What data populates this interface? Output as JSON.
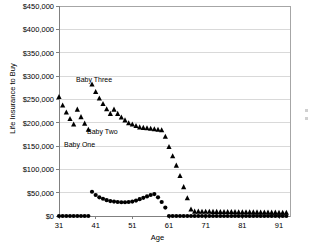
{
  "chart_data": {
    "type": "scatter",
    "title": "",
    "xlabel": "Age",
    "ylabel": "Life Insurance to Buy",
    "xlim": [
      31,
      94
    ],
    "ylim": [
      0,
      450000
    ],
    "xticks": [
      31,
      41,
      51,
      61,
      71,
      81,
      91
    ],
    "yticks": [
      0,
      50000,
      100000,
      150000,
      200000,
      250000,
      300000,
      350000,
      400000,
      450000
    ],
    "ytick_labels": [
      "$0",
      "$50,000",
      "$100,000",
      "$150,000",
      "$200,000",
      "$250,000",
      "$300,000",
      "$350,000",
      "$400,000",
      "$450,000"
    ],
    "xtick_labels": [
      "31",
      "41",
      "51",
      "61",
      "71",
      "81",
      "91"
    ],
    "grid": true,
    "legend_position": "right-cropped",
    "marker_color": "#000000",
    "gridline_color": "#d9d9d9",
    "border_color": "#a6a6a6",
    "series": [
      {
        "name": "insurance-need-triangles",
        "marker": "triangle",
        "x": [
          31,
          32,
          33,
          34,
          35,
          36,
          37,
          38,
          39,
          40,
          41,
          42,
          43,
          44,
          45,
          46,
          47,
          48,
          49,
          50,
          51,
          52,
          53,
          54,
          55,
          56,
          57,
          58,
          59,
          60,
          61,
          62,
          63,
          64,
          65,
          66,
          67,
          68,
          69,
          70,
          71,
          72,
          73,
          74,
          75,
          76,
          77,
          78,
          79,
          80,
          81,
          82,
          83,
          84,
          85,
          86,
          87,
          88,
          89,
          90,
          91,
          92,
          93
        ],
        "y": [
          255000,
          237000,
          222000,
          208000,
          196000,
          228000,
          212000,
          198000,
          185000,
          282000,
          266000,
          252000,
          240000,
          229000,
          219000,
          228000,
          219000,
          211000,
          205000,
          199000,
          196000,
          193000,
          190000,
          189000,
          188000,
          187000,
          186000,
          185000,
          184000,
          170000,
          148000,
          128000,
          108000,
          86000,
          62000,
          38000,
          14000,
          9500,
          9400,
          9300,
          9200,
          9100,
          9000,
          8900,
          8800,
          8700,
          8600,
          8500,
          8400,
          8300,
          8200,
          8100,
          8000,
          7900,
          7800,
          7700,
          7600,
          7500,
          7400,
          7300,
          7200,
          7100,
          7000
        ]
      },
      {
        "name": "available-assets-circles",
        "marker": "circle",
        "x": [
          31,
          32,
          33,
          34,
          35,
          36,
          37,
          38,
          39,
          40,
          41,
          42,
          43,
          44,
          45,
          46,
          47,
          48,
          49,
          50,
          51,
          52,
          53,
          54,
          55,
          56,
          57,
          58,
          59,
          60,
          61,
          62,
          63,
          64,
          65,
          66,
          67,
          68,
          69,
          70,
          71,
          72,
          73,
          74,
          75,
          76,
          77,
          78,
          79,
          80,
          81,
          82,
          83,
          84,
          85,
          86,
          87,
          88,
          89,
          90,
          91,
          92,
          93
        ],
        "y": [
          0,
          0,
          0,
          0,
          0,
          0,
          0,
          0,
          0,
          52000,
          45000,
          40000,
          37000,
          34000,
          32000,
          31000,
          30000,
          29500,
          29500,
          30000,
          31000,
          33000,
          36000,
          39000,
          42000,
          45000,
          47000,
          40000,
          30000,
          18000,
          0,
          0,
          0,
          0,
          0,
          0,
          0,
          0,
          0,
          0,
          0,
          0,
          0,
          0,
          0,
          0,
          0,
          0,
          0,
          0,
          0,
          0,
          0,
          0,
          0,
          0,
          0,
          0,
          0,
          0,
          0,
          0,
          0
        ]
      }
    ],
    "annotations": [
      {
        "label": "Baby Three",
        "x_px": 76,
        "y_px": 76
      },
      {
        "label": "Baby Two",
        "x_px": 87,
        "y_px": 128
      },
      {
        "label": "Baby One",
        "x_px": 64,
        "y_px": 141
      }
    ]
  }
}
